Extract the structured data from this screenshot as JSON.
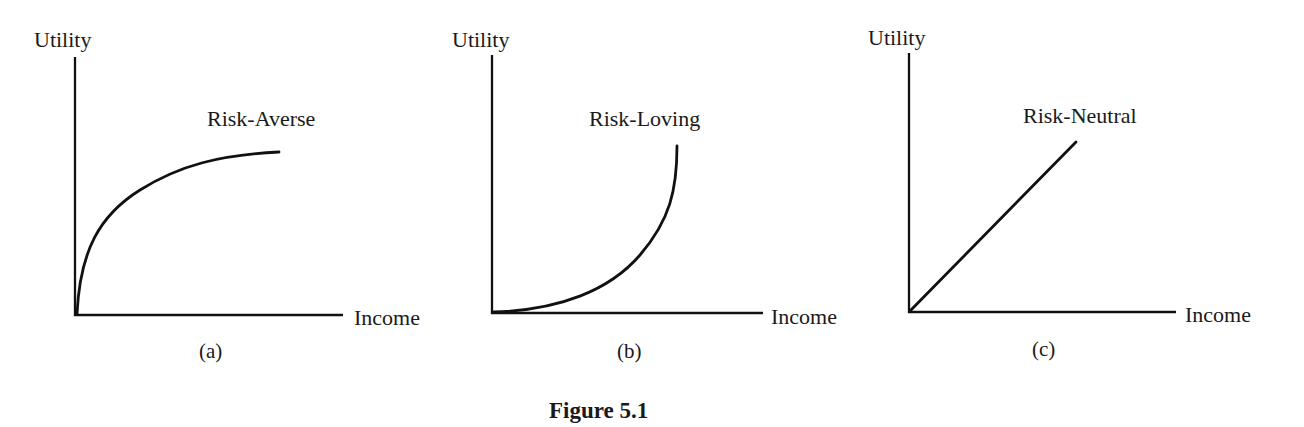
{
  "figure": {
    "title": "Figure 5.1"
  },
  "panels": [
    {
      "id": "a",
      "caption": "(a)",
      "y_label": "Utility",
      "x_label": "Income",
      "curve_label": "Risk-Averse",
      "shape": "concave"
    },
    {
      "id": "b",
      "caption": "(b)",
      "y_label": "Utility",
      "x_label": "Income",
      "curve_label": "Risk-Loving",
      "shape": "convex"
    },
    {
      "id": "c",
      "caption": "(c)",
      "y_label": "Utility",
      "x_label": "Income",
      "curve_label": "Risk-Neutral",
      "shape": "linear"
    }
  ],
  "colors": {
    "ink": "#111111",
    "background": "#ffffff"
  }
}
